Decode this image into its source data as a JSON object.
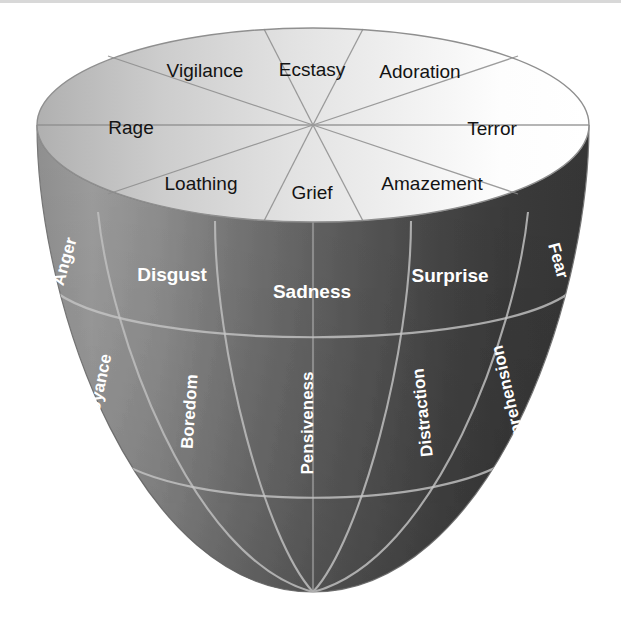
{
  "figure": {
    "name": "plutchik-emotion-cone",
    "background_color": "#ffffff",
    "geometry": {
      "top_ellipse_center_x": 313,
      "top_ellipse_center_y": 125,
      "top_ellipse_rx": 276,
      "top_ellipse_ry": 97,
      "bottom_tip_x": 313,
      "bottom_tip_y": 592
    },
    "colors": {
      "top_face_light": "#f2f2f2",
      "top_face_white": "#ffffff",
      "top_face_gray": "#b5b5b5",
      "body_light_gray": "#a0a0a0",
      "body_mid_gray": "#7c7c7c",
      "body_dark_gray": "#5e5e5e",
      "body_darkest": "#383838",
      "edge_line": "#8a8a8a",
      "grid_line": "#b9b9b9",
      "label_dark": "#131313",
      "label_light": "#ffffff"
    }
  },
  "top_face": {
    "name": "top-sectors",
    "sectors": [
      {
        "id": "ecstasy",
        "label": "Ecstasy",
        "x": 312,
        "y": 70,
        "anchor": "middle",
        "rotate": 0
      },
      {
        "id": "adoration",
        "label": "Adoration",
        "x": 419,
        "y": 73,
        "anchor": "middle",
        "rotate": 0
      },
      {
        "id": "terror",
        "label": "Terror",
        "x": 492,
        "y": 130,
        "anchor": "middle",
        "rotate": 0
      },
      {
        "id": "amazement",
        "label": "Amazement",
        "x": 431,
        "y": 186,
        "anchor": "middle",
        "rotate": 0
      },
      {
        "id": "grief",
        "label": "Grief",
        "x": 312,
        "y": 194,
        "anchor": "middle",
        "rotate": 0
      },
      {
        "id": "loathing",
        "label": "Loathing",
        "x": 202,
        "y": 186,
        "anchor": "middle",
        "rotate": 0
      },
      {
        "id": "rage",
        "label": "Rage",
        "x": 130,
        "y": 128,
        "anchor": "middle",
        "rotate": 0
      },
      {
        "id": "vigilance",
        "label": "Vigilance",
        "x": 205,
        "y": 71,
        "anchor": "middle",
        "rotate": 0
      }
    ]
  },
  "mid_band": {
    "name": "primary-emotions",
    "sectors": [
      {
        "id": "anger",
        "label": "Anger",
        "x": 70,
        "y": 263,
        "rotate": -74,
        "size": "small"
      },
      {
        "id": "disgust",
        "label": "Disgust",
        "x": 172,
        "y": 275,
        "rotate": 0,
        "size": "normal"
      },
      {
        "id": "sadness",
        "label": "Sadness",
        "x": 312,
        "y": 292,
        "rotate": 0,
        "size": "normal"
      },
      {
        "id": "surprise",
        "label": "Surprise",
        "x": 450,
        "y": 276,
        "rotate": 0,
        "size": "normal"
      },
      {
        "id": "fear",
        "label": "Fear",
        "x": 553,
        "y": 262,
        "rotate": 74,
        "size": "small"
      }
    ]
  },
  "bottom_band": {
    "name": "mild-emotions",
    "sectors": [
      {
        "id": "annoyance",
        "label": "Annoyance",
        "x": 102,
        "y": 400,
        "rotate": -78
      },
      {
        "id": "boredom",
        "label": "Boredom",
        "x": 195,
        "y": 412,
        "rotate": -86
      },
      {
        "id": "pensiveness",
        "label": "Pensiveness",
        "x": 313,
        "y": 423,
        "rotate": -90
      },
      {
        "id": "distraction",
        "label": "Distraction",
        "x": 428,
        "y": 412,
        "rotate": -96
      },
      {
        "id": "apprehension",
        "label": "Apprehension",
        "x": 515,
        "y": 400,
        "rotate": -103
      }
    ]
  }
}
